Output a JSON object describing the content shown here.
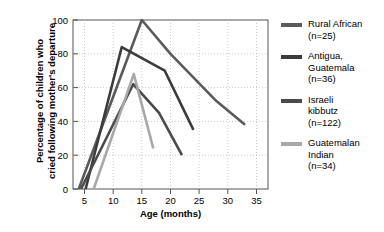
{
  "chart_data": {
    "type": "line",
    "title": "",
    "xlabel": "Age (months)",
    "ylabel": "Percentage of children who cried following mother's departure",
    "ylabel_line1": "Percentage of children who",
    "ylabel_line2": "cried following mother's departure",
    "xlim": [
      3,
      37
    ],
    "ylim": [
      0,
      100
    ],
    "xticks": [
      5,
      10,
      15,
      20,
      25,
      30,
      35
    ],
    "yticks": [
      0,
      20,
      40,
      60,
      80,
      100
    ],
    "grid": true,
    "legend_position": "right",
    "series": [
      {
        "name": "Rural African",
        "label_line1": "Rural African",
        "label_line2": "(n=25)",
        "n": 25,
        "color": "#5a5a5a",
        "x": [
          4.0,
          15.0,
          20.0,
          28.0,
          33.0
        ],
        "y": [
          0,
          100,
          80,
          52,
          38
        ]
      },
      {
        "name": "Antigua, Guatemala",
        "label_line1": "Antigua,",
        "label_line2": "Guatemala",
        "label_line3": "(n=36)",
        "n": 36,
        "color": "#3c3c3c",
        "x": [
          5.2,
          11.5,
          19.0,
          24.0
        ],
        "y": [
          0,
          84,
          70,
          35
        ]
      },
      {
        "name": "Israeli kibbutz",
        "label_line1": "Israeli",
        "label_line2": "kibbutz",
        "label_line3": "(n=122)",
        "n": 122,
        "color": "#4a4a4a",
        "x": [
          4.4,
          13.5,
          18.0,
          22.0
        ],
        "y": [
          0,
          62,
          45,
          20
        ]
      },
      {
        "name": "Guatemalan Indian",
        "label_line1": "Guatemalan",
        "label_line2": "Indian",
        "label_line3": "(n=34)",
        "n": 34,
        "color": "#a8a8a8",
        "x": [
          6.6,
          13.6,
          17.0
        ],
        "y": [
          0,
          68,
          24
        ]
      }
    ]
  },
  "axis": {
    "ytick_0": "0",
    "ytick_20": "20",
    "ytick_40": "40",
    "ytick_60": "60",
    "ytick_80": "80",
    "ytick_100": "100",
    "xtick_5": "5",
    "xtick_10": "10",
    "xtick_15": "15",
    "xtick_20": "20",
    "xtick_25": "25",
    "xtick_30": "30",
    "xtick_35": "35"
  },
  "colors": {
    "axis": "#555555",
    "grid": "#bbbbbb",
    "text": "#000000"
  }
}
